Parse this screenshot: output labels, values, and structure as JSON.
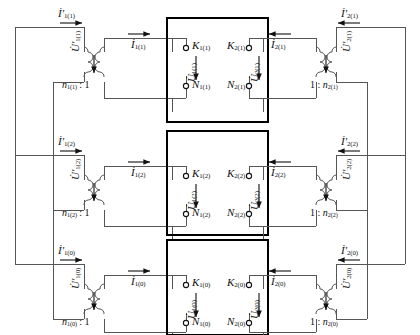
{
  "figure": {
    "type": "circuit-diagram",
    "rows": 3,
    "colors": {
      "wire": "#555555",
      "box": "#000000",
      "text": "#111111"
    }
  },
  "rows": [
    {
      "seq": "(1)",
      "left": {
        "source_current": "İ'",
        "source_current_sub": "1(1)",
        "source_voltage": "U̇'",
        "source_voltage_sub": "1(1)",
        "ratio": "n",
        "ratio_sub": "1(1)",
        "ratio_tail": ": 1",
        "sec_current": "İ",
        "sec_current_sub": "1(1)"
      },
      "box": {
        "k_terminal": "K",
        "k_terminal_sub": "1(1)",
        "n_terminal": "N",
        "n_terminal_sub": "1(1)",
        "voltage": "U̇",
        "voltage_sub": "1(1)",
        "k_terminal_r": "K",
        "k_terminal_r_sub": "2(1)",
        "n_terminal_r": "N",
        "n_terminal_r_sub": "2(1)",
        "voltage_r": "U̇",
        "voltage_r_sub": "2(1)"
      },
      "right": {
        "sec_current": "İ",
        "sec_current_sub": "2(1)",
        "ratio_head": "1 :",
        "ratio": "n",
        "ratio_sub": "2(1)",
        "source_current": "İ'",
        "source_current_sub": "2(1)",
        "source_voltage": "U̇'",
        "source_voltage_sub": "2(1)"
      }
    },
    {
      "seq": "(2)",
      "left": {
        "source_current": "İ'",
        "source_current_sub": "1(2)",
        "source_voltage": "U̇'",
        "source_voltage_sub": "1(2)",
        "ratio": "n",
        "ratio_sub": "1(2)",
        "ratio_tail": ": 1",
        "sec_current": "İ",
        "sec_current_sub": "1(2)"
      },
      "box": {
        "k_terminal": "K",
        "k_terminal_sub": "1(2)",
        "n_terminal": "N",
        "n_terminal_sub": "1(2)",
        "voltage": "U̇",
        "voltage_sub": "1(2)",
        "k_terminal_r": "K",
        "k_terminal_r_sub": "2(2)",
        "n_terminal_r": "N",
        "n_terminal_r_sub": "2(2)",
        "voltage_r": "U̇",
        "voltage_r_sub": "2(2)"
      },
      "right": {
        "sec_current": "İ",
        "sec_current_sub": "2(2)",
        "ratio_head": "1 :",
        "ratio": "n",
        "ratio_sub": "2(2)",
        "source_current": "İ'",
        "source_current_sub": "2(2)",
        "source_voltage": "U̇'",
        "source_voltage_sub": "2(2)"
      }
    },
    {
      "seq": "(0)",
      "left": {
        "source_current": "İ'",
        "source_current_sub": "1(0)",
        "source_voltage": "U̇'",
        "source_voltage_sub": "1(0)",
        "ratio": "n",
        "ratio_sub": "1(0)",
        "ratio_tail": ": 1",
        "sec_current": "İ",
        "sec_current_sub": "1(0)"
      },
      "box": {
        "k_terminal": "K",
        "k_terminal_sub": "1(0)",
        "n_terminal": "N",
        "n_terminal_sub": "1(0)",
        "voltage": "U̇",
        "voltage_sub": "1(0)",
        "k_terminal_r": "K",
        "k_terminal_r_sub": "2(0)",
        "n_terminal_r": "N",
        "n_terminal_r_sub": "2(0)",
        "voltage_r": "U̇",
        "voltage_r_sub": "2(0)"
      },
      "right": {
        "sec_current": "İ",
        "sec_current_sub": "2(0)",
        "ratio_head": "1 :",
        "ratio": "n",
        "ratio_sub": "2(0)",
        "source_current": "İ'",
        "source_current_sub": "2(0)",
        "source_voltage": "U̇'",
        "source_voltage_sub": "2(0)"
      }
    }
  ]
}
